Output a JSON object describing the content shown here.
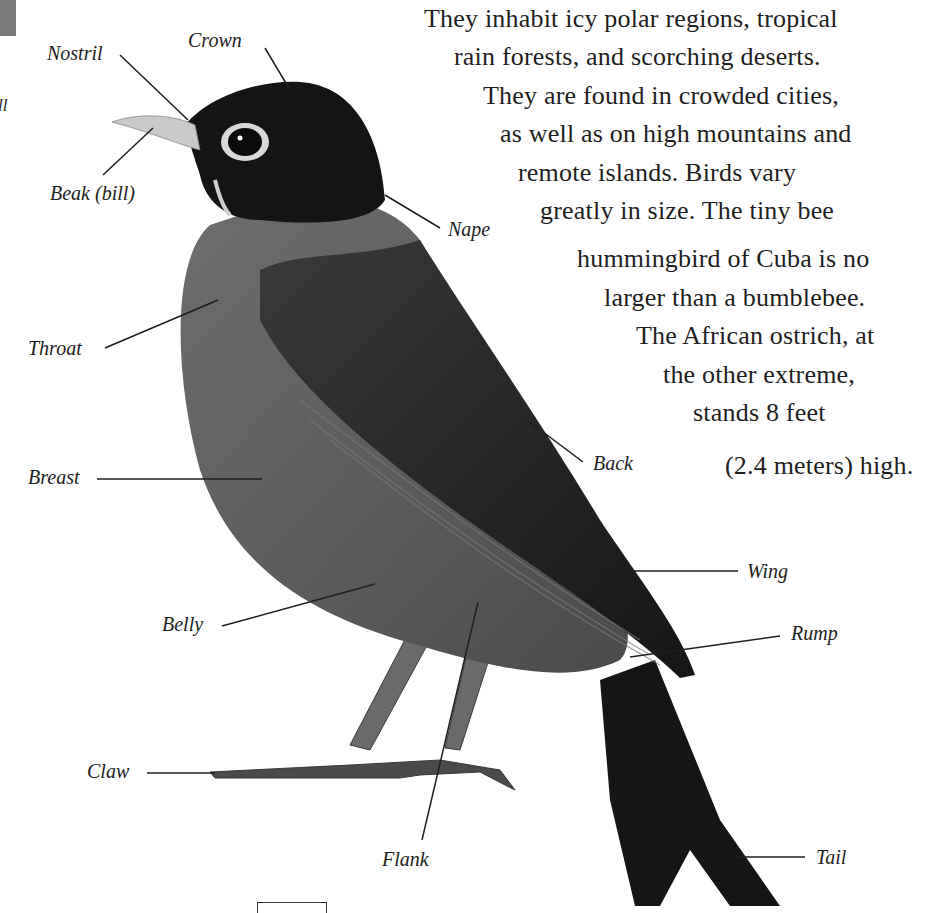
{
  "page": {
    "cut_off_label": "ll",
    "body_text_lines": [
      "They inhabit icy polar regions, tropical",
      "rain forests, and scorching deserts.",
      "They are found in crowded cities,",
      "as well as on high mountains and",
      "remote islands. Birds vary",
      "greatly in size. The tiny bee",
      "hummingbird of Cuba is no",
      "larger than a bumblebee.",
      "The African ostrich, at",
      "the other extreme,",
      "stands 8 feet",
      "(2.4 meters) high."
    ]
  },
  "diagram": {
    "labels": {
      "nostril": "Nostril",
      "crown": "Crown",
      "beak": "Beak (bill)",
      "nape": "Nape",
      "throat": "Throat",
      "breast": "Breast",
      "back": "Back",
      "wing": "Wing",
      "rump": "Rump",
      "belly": "Belly",
      "claw": "Claw",
      "flank": "Flank",
      "tail": "Tail"
    }
  }
}
